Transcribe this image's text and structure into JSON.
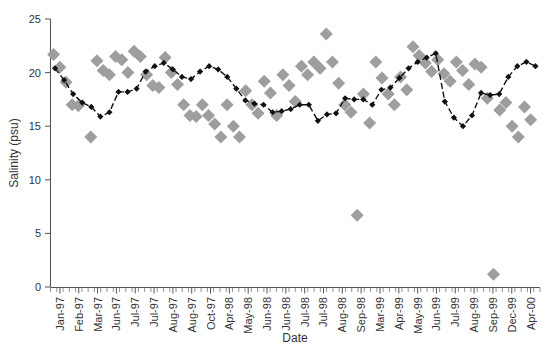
{
  "chart_data": {
    "type": "scatter",
    "title": "",
    "xlabel": "Date",
    "ylabel": "Salinity (psu)",
    "ylim": [
      0,
      25
    ],
    "yticks": [
      0,
      5,
      10,
      15,
      20,
      25
    ],
    "ytick_labels": [
      "0",
      "5",
      "10",
      "15",
      "20",
      "25"
    ],
    "grid": false,
    "legend": "none",
    "x_tick_labels": [
      "Jan-97",
      "Feb-97",
      "Mar-97",
      "Jun-97",
      "Jul-97",
      "Jul-97",
      "Aug-97",
      "Aug-97",
      "Oct-97",
      "Apr-98",
      "May-98",
      "Jun-98",
      "Jun-98",
      "Jul-98",
      "Jul-98",
      "Aug-98",
      "Sep-98",
      "Mar-99",
      "Apr-99",
      "May-99",
      "Jun-99",
      "Jul-99",
      "Aug-99",
      "Sep-99",
      "Dec-99",
      "Apr-00"
    ],
    "series": [
      {
        "name": "individual-observations",
        "marker": "diamond",
        "color": "#9e9e9e",
        "x": [
          1,
          2,
          3,
          4,
          5,
          7,
          8,
          9,
          10,
          11,
          12,
          13,
          14,
          15,
          16,
          17,
          18,
          19,
          20,
          21,
          22,
          23,
          24,
          25,
          26,
          27,
          28,
          29,
          30,
          31,
          32,
          33,
          34,
          35,
          36,
          37,
          38,
          39,
          40,
          41,
          42,
          43,
          44,
          45,
          46,
          47,
          48,
          49,
          50,
          51,
          52,
          53,
          54,
          55,
          56,
          57,
          58,
          59,
          60,
          61,
          62,
          63,
          64,
          65,
          66,
          67,
          68,
          69,
          70,
          71,
          72,
          73,
          74,
          75,
          76,
          77,
          78
        ],
        "values": [
          21.7,
          20.5,
          19.1,
          17.0,
          16.9,
          14.0,
          21.1,
          20.2,
          19.8,
          21.5,
          21.2,
          20.0,
          22.0,
          21.5,
          19.8,
          18.8,
          18.6,
          21.4,
          20.0,
          18.9,
          17.0,
          16.0,
          15.9,
          17.0,
          16.0,
          15.2,
          14.0,
          17.0,
          15.0,
          14.0,
          18.3,
          17.0,
          16.2,
          19.2,
          18.1,
          16.0,
          19.8,
          18.8,
          17.3,
          20.6,
          19.8,
          21.0,
          20.4,
          23.6,
          21.0,
          19.0,
          17.0,
          16.3,
          6.7,
          18.0,
          15.3,
          21.0,
          19.5,
          18.0,
          17.0,
          19.6,
          18.4,
          22.4,
          21.6,
          20.9,
          20.1,
          21.2,
          19.9,
          19.2,
          21.0,
          20.2,
          18.9,
          20.8,
          20.5,
          17.6,
          1.2,
          16.5,
          17.2,
          15.0,
          14.0,
          16.8,
          15.6
        ]
      },
      {
        "name": "monthly-mean",
        "marker": "small-diamond",
        "color": "#111111",
        "line": "dashed",
        "x": [
          1,
          2,
          3,
          4,
          5,
          6,
          7,
          8,
          9,
          10,
          11,
          12,
          13,
          14,
          15,
          16,
          17,
          18,
          19,
          20,
          21,
          22,
          23,
          24,
          25,
          26,
          27,
          28,
          29,
          30,
          31,
          32,
          33,
          34,
          35,
          36,
          37,
          38,
          39,
          40,
          41,
          42,
          43,
          44,
          45,
          46,
          47,
          48,
          49,
          50,
          51,
          52,
          53,
          54
        ],
        "values": [
          20.4,
          19.3,
          18.0,
          17.2,
          16.8,
          15.9,
          16.3,
          18.2,
          18.2,
          18.5,
          20.1,
          20.6,
          20.9,
          20.3,
          19.6,
          19.4,
          20.1,
          20.6,
          20.3,
          19.6,
          18.5,
          17.4,
          17.1,
          17.0,
          16.3,
          16.4,
          16.6,
          17.0,
          17.0,
          15.5,
          16.1,
          16.2,
          17.6,
          17.5,
          17.5,
          17.0,
          18.4,
          18.6,
          19.5,
          20.4,
          21.0,
          21.4,
          21.8,
          17.3,
          15.8,
          15.0,
          16.0,
          18.1,
          17.9,
          18.0,
          19.6,
          20.6,
          21.0,
          20.6
        ]
      }
    ]
  },
  "axes": {
    "y_title": "Salinity (psu)",
    "x_title": "Date"
  }
}
